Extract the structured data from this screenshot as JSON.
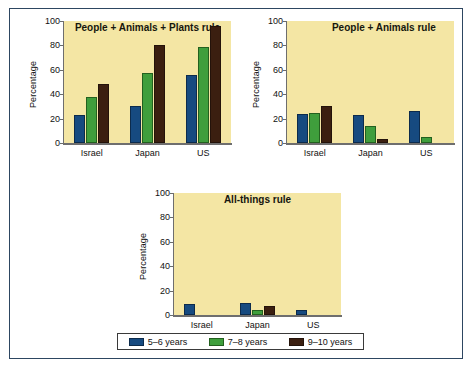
{
  "figure": {
    "background_color": "#ffffff",
    "frame_color": "#2d4661",
    "plot_background_color": "#f4e6a4"
  },
  "legend": {
    "entries": [
      {
        "label": "5–6 years",
        "color": "#164a80"
      },
      {
        "label": "7–8 years",
        "color": "#3f9e3c"
      },
      {
        "label": "9–10 years",
        "color": "#3b1f10"
      }
    ]
  },
  "chart_data": [
    {
      "type": "bar",
      "title": "People + Animals + Plants rule",
      "xlabel": "",
      "ylabel": "Percentage",
      "categories": [
        "Israel",
        "Japan",
        "US"
      ],
      "ylim": [
        0,
        100
      ],
      "yticks": [
        0,
        20,
        40,
        60,
        80,
        100
      ],
      "grid": false,
      "legend_position": "below-figure",
      "series": [
        {
          "name": "5–6 years",
          "color": "#164a80",
          "values": [
            23,
            30,
            56
          ]
        },
        {
          "name": "7–8 years",
          "color": "#3f9e3c",
          "values": [
            38,
            57,
            79
          ]
        },
        {
          "name": "9–10 years",
          "color": "#3b1f10",
          "values": [
            48,
            80,
            96
          ]
        }
      ]
    },
    {
      "type": "bar",
      "title": "People + Animals rule",
      "xlabel": "",
      "ylabel": "Percentage",
      "categories": [
        "Israel",
        "Japan",
        "US"
      ],
      "ylim": [
        0,
        100
      ],
      "yticks": [
        0,
        20,
        40,
        60,
        80,
        100
      ],
      "grid": false,
      "legend_position": "below-figure",
      "series": [
        {
          "name": "5–6 years",
          "color": "#164a80",
          "values": [
            24,
            23,
            26
          ]
        },
        {
          "name": "7–8 years",
          "color": "#3f9e3c",
          "values": [
            25,
            14,
            5
          ]
        },
        {
          "name": "9–10 years",
          "color": "#3b1f10",
          "values": [
            30,
            3,
            0
          ]
        }
      ]
    },
    {
      "type": "bar",
      "title": "All-things rule",
      "xlabel": "",
      "ylabel": "Percentage",
      "categories": [
        "Israel",
        "Japan",
        "US"
      ],
      "ylim": [
        0,
        100
      ],
      "yticks": [
        0,
        20,
        40,
        60,
        80,
        100
      ],
      "grid": false,
      "legend_position": "below-figure",
      "series": [
        {
          "name": "5–6 years",
          "color": "#164a80",
          "values": [
            9,
            10,
            4
          ]
        },
        {
          "name": "7–8 years",
          "color": "#3f9e3c",
          "values": [
            0,
            4,
            0
          ]
        },
        {
          "name": "9–10 years",
          "color": "#3b1f10",
          "values": [
            0,
            7,
            0
          ]
        }
      ]
    }
  ]
}
